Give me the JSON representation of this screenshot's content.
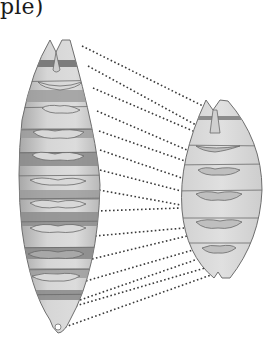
{
  "caption": "ple)",
  "colors": {
    "outline": "#6e6e6e",
    "body_light": "#d9d9d9",
    "band_dark": "#8f8f8f",
    "band_mid": "#b5b5b5",
    "dots": "#3a3a3a"
  },
  "left_embryo": {
    "label": "elongated embryo",
    "stripe_count": 14
  },
  "right_embryo": {
    "label": "compact embryo",
    "segment_count": 8
  },
  "connector_lines": [
    {
      "x1": 82,
      "y1": 46,
      "x2": 207,
      "y2": 108
    },
    {
      "x1": 88,
      "y1": 66,
      "x2": 196,
      "y2": 125
    },
    {
      "x1": 93,
      "y1": 88,
      "x2": 193,
      "y2": 131
    },
    {
      "x1": 97,
      "y1": 111,
      "x2": 187,
      "y2": 150
    },
    {
      "x1": 99,
      "y1": 131,
      "x2": 185,
      "y2": 161
    },
    {
      "x1": 100,
      "y1": 150,
      "x2": 182,
      "y2": 178
    },
    {
      "x1": 100,
      "y1": 170,
      "x2": 181,
      "y2": 191
    },
    {
      "x1": 99,
      "y1": 190,
      "x2": 181,
      "y2": 205
    },
    {
      "x1": 97,
      "y1": 211,
      "x2": 181,
      "y2": 208
    },
    {
      "x1": 95,
      "y1": 236,
      "x2": 184,
      "y2": 228
    },
    {
      "x1": 92,
      "y1": 259,
      "x2": 187,
      "y2": 236
    },
    {
      "x1": 86,
      "y1": 281,
      "x2": 193,
      "y2": 250
    },
    {
      "x1": 80,
      "y1": 300,
      "x2": 198,
      "y2": 259
    },
    {
      "x1": 72,
      "y1": 307,
      "x2": 205,
      "y2": 268
    },
    {
      "x1": 65,
      "y1": 327,
      "x2": 211,
      "y2": 275
    }
  ]
}
